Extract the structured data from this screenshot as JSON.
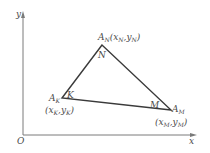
{
  "diagram": {
    "type": "coordinate-geometry",
    "axes": {
      "x_label": "x",
      "y_label": "y",
      "origin_label": "O"
    },
    "triangle": {
      "vertices": [
        {
          "id": "N",
          "point_label": "A",
          "point_sub": "N",
          "coord_open": "(x",
          "coord_x_sub": "N",
          "coord_sep": ",y",
          "coord_y_sub": "N",
          "coord_close": ")",
          "angle_label": "N"
        },
        {
          "id": "K",
          "point_label": "A",
          "point_sub": "K",
          "coord_open": "(x",
          "coord_x_sub": "K",
          "coord_sep": ",y",
          "coord_y_sub": "K",
          "coord_close": ")",
          "angle_label": "K"
        },
        {
          "id": "M",
          "point_label": "A",
          "point_sub": "M",
          "coord_open": "(x",
          "coord_x_sub": "M",
          "coord_sep": ",y",
          "coord_y_sub": "M",
          "coord_close": ")",
          "angle_label": "M"
        }
      ]
    }
  }
}
